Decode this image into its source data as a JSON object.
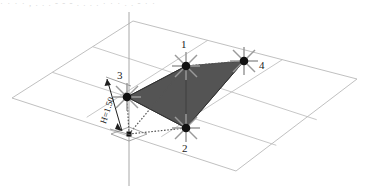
{
  "figure": {
    "title_strip": "· · · · ,  . . . - - -  . . . . · · ·   . .  -  · ·",
    "background_color": "#ffffff",
    "grid_line_color": "#b9b9b9",
    "axis_line_color": "#a8a8a8",
    "triangle_fill_color": "#545454",
    "triangle_edge_color": "#3a3a3a",
    "node_dot_color": "#111111",
    "support_star_color": "#9a9a9a",
    "dotted_line_color": "#555555",
    "dimension_line_color": "#202020"
  },
  "ground_plane": {
    "name": "isometric-grid-plane",
    "outline": "12,98 133,21 357,79 236,171",
    "divisions_u": 3,
    "divisions_v": 2
  },
  "vertical_axis": {
    "name": "vertical-z-axis",
    "x": 129,
    "top_y": 12,
    "bottom_y": 186
  },
  "nodes": [
    {
      "id": "1",
      "label": "1",
      "x": 186,
      "y": 66,
      "label_x": 181,
      "label_y": 39,
      "marker": "support-star"
    },
    {
      "id": "2",
      "label": "2",
      "x": 186,
      "y": 128,
      "label_x": 182,
      "label_y": 143,
      "marker": "support-star"
    },
    {
      "id": "3",
      "label": "3",
      "x": 127,
      "y": 97,
      "label_x": 117,
      "label_y": 70,
      "marker": "support-star"
    },
    {
      "id": "4",
      "label": "4",
      "x": 244,
      "y": 61,
      "label_x": 259,
      "label_y": 60,
      "marker": "support-star"
    }
  ],
  "base_node": {
    "name": "base-node",
    "label": "",
    "x": 129,
    "y": 134,
    "marker": "small-diamond"
  },
  "triangle": {
    "name": "shaded-triangle-panel",
    "vertices": "186,66 244,61 186,128 127,97"
  },
  "dotted_links": [
    {
      "name": "dotted-link-1-4",
      "from": "186,66",
      "to": "244,61"
    },
    {
      "name": "dotted-link-base-2",
      "from": "129,134",
      "to": "186,128"
    },
    {
      "name": "dotted-link-base-3",
      "from": "129,134",
      "to": "127,97"
    },
    {
      "name": "dotted-link-base-1",
      "from": "129,134",
      "to": "186,66"
    }
  ],
  "dimension": {
    "name": "height-dimension",
    "text": "H=1.50",
    "label_x": 99,
    "label_y": 122,
    "line_top": "106,77",
    "line_bottom": "124,133",
    "extension_top": "106,77 131,86",
    "extension_bottom": "110,129 131,135"
  }
}
